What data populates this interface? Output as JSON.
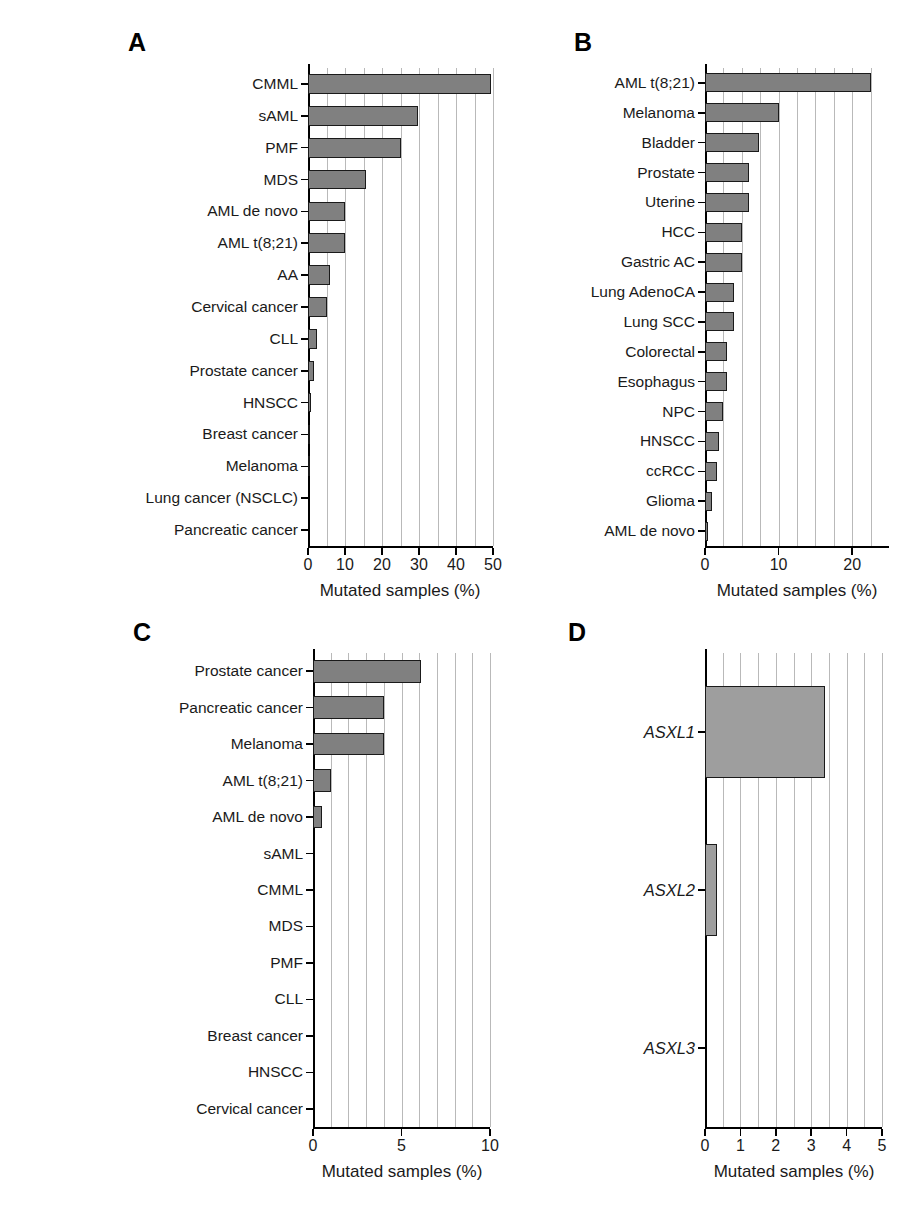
{
  "figure": {
    "panel_labels": {
      "a": "A",
      "b": "B",
      "c": "C",
      "d": "D"
    },
    "axis_title": "Mutated samples (%)",
    "colors": {
      "bar_fill_dark": "#808080",
      "bar_fill_light": "#9e9e9e",
      "bar_stroke": "#1a1a1a",
      "gridline": "#b9b9b9",
      "axis": "#000000",
      "text": "#1a1a1a",
      "background": "#ffffff"
    }
  },
  "chart_data": [
    {
      "id": "panel-a",
      "panel": "A",
      "type": "bar",
      "orientation": "horizontal",
      "title": "",
      "xlabel": "Mutated samples (%)",
      "ylabel": "",
      "xlim": [
        0,
        50
      ],
      "xticks": [
        0,
        10,
        20,
        30,
        40,
        50
      ],
      "xtick_labels": [
        "0",
        "10",
        "20",
        "30",
        "40",
        "50"
      ],
      "minor_gridlines": [
        5,
        15,
        25,
        35,
        45
      ],
      "grid": true,
      "legend": "none",
      "categories": [
        "CMML",
        "sAML",
        "PMF",
        "MDS",
        "AML de novo",
        "AML t(8;21)",
        "AA",
        "Cervical cancer",
        "CLL",
        "Prostate cancer",
        "HNSCC",
        "Breast cancer",
        "Melanoma",
        "Lung cancer (NSCLC)",
        "Pancreatic cancer"
      ],
      "values": [
        49.5,
        29.8,
        25.0,
        15.8,
        10.0,
        10.0,
        6.0,
        5.0,
        2.4,
        1.6,
        0.9,
        0.6,
        0.6,
        0,
        0
      ]
    },
    {
      "id": "panel-b",
      "panel": "B",
      "type": "bar",
      "orientation": "horizontal",
      "title": "",
      "xlabel": "Mutated samples (%)",
      "ylabel": "",
      "xlim": [
        0,
        25
      ],
      "xticks": [
        0,
        10,
        20
      ],
      "xtick_labels": [
        "0",
        "10",
        "20"
      ],
      "minor_gridlines": [
        2.5,
        5,
        7.5,
        12.5,
        15,
        17.5,
        22.5
      ],
      "grid": true,
      "legend": "none",
      "categories": [
        "AML t(8;21)",
        "Melanoma",
        "Bladder",
        "Prostate",
        "Uterine",
        "HCC",
        "Gastric AC",
        "Lung AdenoCA",
        "Lung SCC",
        "Colorectal",
        "Esophagus",
        "NPC",
        "HNSCC",
        "ccRCC",
        "Glioma",
        "AML de novo"
      ],
      "values": [
        22.6,
        10.0,
        7.4,
        6.0,
        6.0,
        5.0,
        5.0,
        4.0,
        4.0,
        3.0,
        3.0,
        2.4,
        1.9,
        1.6,
        0.9,
        0.4
      ]
    },
    {
      "id": "panel-c",
      "panel": "C",
      "type": "bar",
      "orientation": "horizontal",
      "title": "",
      "xlabel": "Mutated samples (%)",
      "ylabel": "",
      "xlim": [
        0,
        10
      ],
      "xticks": [
        0,
        5,
        10
      ],
      "xtick_labels": [
        "0",
        "5",
        "10"
      ],
      "minor_gridlines": [
        1,
        2,
        3,
        4,
        6,
        7,
        8,
        9
      ],
      "grid": true,
      "legend": "none",
      "categories": [
        "Prostate cancer",
        "Pancreatic cancer",
        "Melanoma",
        "AML t(8;21)",
        "AML de novo",
        "sAML",
        "CMML",
        "MDS",
        "PMF",
        "CLL",
        "Breast cancer",
        "HNSCC",
        "Cervical cancer"
      ],
      "values": [
        6.1,
        4.0,
        4.0,
        1.0,
        0.5,
        0,
        0,
        0,
        0,
        0,
        0,
        0,
        0
      ]
    },
    {
      "id": "panel-d",
      "panel": "D",
      "type": "bar",
      "orientation": "horizontal",
      "title": "",
      "xlabel": "Mutated samples (%)",
      "ylabel": "",
      "xlim": [
        0,
        5
      ],
      "xticks": [
        0,
        1,
        2,
        3,
        4,
        5
      ],
      "xtick_labels": [
        "0",
        "1",
        "2",
        "3",
        "4",
        "5"
      ],
      "minor_gridlines": [
        0.5,
        1.5,
        2.5,
        3.5,
        4.5
      ],
      "grid": true,
      "legend": "none",
      "categories": [
        "ASXL1",
        "ASXL2",
        "ASXL3"
      ],
      "values": [
        3.4,
        0.35,
        0
      ]
    }
  ]
}
